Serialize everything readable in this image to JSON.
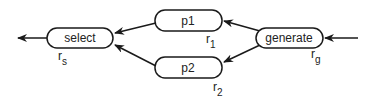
{
  "diagram": {
    "nodes": [
      {
        "id": "select",
        "label": "select",
        "rate": "r",
        "rate_sub": "s"
      },
      {
        "id": "p1",
        "label": "p1",
        "rate": "r",
        "rate_sub": "1"
      },
      {
        "id": "p2",
        "label": "p2",
        "rate": "r",
        "rate_sub": "2"
      },
      {
        "id": "generate",
        "label": "generate",
        "rate": "r",
        "rate_sub": "g"
      }
    ],
    "edges": [
      {
        "from": "input",
        "to": "generate"
      },
      {
        "from": "generate",
        "to": "p1"
      },
      {
        "from": "generate",
        "to": "p2"
      },
      {
        "from": "p1",
        "to": "select"
      },
      {
        "from": "p2",
        "to": "select"
      },
      {
        "from": "select",
        "to": "output"
      }
    ],
    "colors": {
      "stroke": "#1a1a1a",
      "background": "#ffffff"
    }
  }
}
